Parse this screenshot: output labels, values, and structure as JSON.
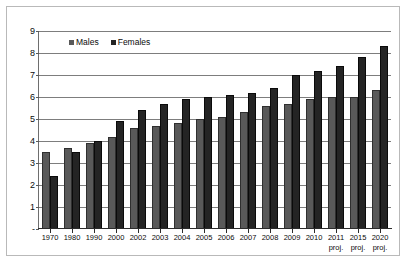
{
  "chart_data": {
    "type": "bar",
    "title": "",
    "subtitle": "",
    "xlabel": "",
    "ylabel": "",
    "ylim": [
      0,
      9
    ],
    "yticks": [
      "-",
      "1",
      "2",
      "3",
      "4",
      "5",
      "6",
      "7",
      "8",
      "9"
    ],
    "ytick_values": [
      0,
      1,
      2,
      3,
      4,
      5,
      6,
      7,
      8,
      9
    ],
    "grid": true,
    "legend_position": "top-left",
    "categories": [
      "1970",
      "1980",
      "1990",
      "2000",
      "2002",
      "2003",
      "2004",
      "2005",
      "2006",
      "2007",
      "2008",
      "2009",
      "2010",
      "2011",
      "2015",
      "2020"
    ],
    "category_sublabels": [
      "",
      "",
      "",
      "",
      "",
      "",
      "",
      "",
      "",
      "",
      "",
      "",
      "",
      "proj.",
      "proj.",
      "proj."
    ],
    "series": [
      {
        "name": "Males",
        "color": "#595959",
        "values": [
          3.5,
          3.7,
          3.9,
          4.2,
          4.6,
          4.7,
          4.8,
          5.0,
          5.1,
          5.3,
          5.6,
          5.7,
          5.9,
          6.0,
          6.0,
          6.3
        ]
      },
      {
        "name": "Females",
        "color": "#242424",
        "values": [
          2.4,
          3.5,
          4.0,
          4.9,
          5.4,
          5.7,
          5.9,
          6.0,
          6.1,
          6.2,
          6.4,
          7.0,
          7.2,
          7.4,
          7.8,
          8.3
        ]
      }
    ]
  },
  "legend": {
    "items": [
      {
        "label": "Males",
        "swatch": "male-swatch-icon"
      },
      {
        "label": "Females",
        "swatch": "female-swatch-icon"
      }
    ]
  },
  "colors": {
    "males": "#595959",
    "females": "#242424",
    "gridline": "#7d7d7d",
    "frame": "#b9b9b9",
    "axis": "#2b2b2b",
    "background": "#ffffff"
  }
}
